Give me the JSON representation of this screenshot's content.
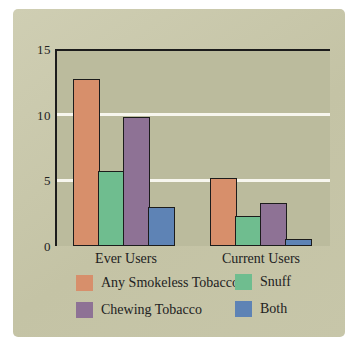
{
  "colors": {
    "page_bg": "#ffffff",
    "card_bg": "#c4c3a5",
    "card_bg_light": "#cfceb3",
    "card_bg2": "#c7c6a9",
    "plot_bg": "#bbbb9d",
    "grid": "#f7f6ee",
    "axis": "#1c1c1c",
    "text": "#222222"
  },
  "chart_data": {
    "type": "bar",
    "title": "",
    "categories": [
      "Ever Users",
      "Current Users"
    ],
    "series": [
      {
        "name": "Any Smokeless Tobacco",
        "color": "#d78f6b",
        "values": [
          12.7,
          5.2
        ]
      },
      {
        "name": "Snuff",
        "color": "#6fbd8f",
        "values": [
          5.7,
          2.3
        ]
      },
      {
        "name": "Chewing Tobacco",
        "color": "#8e7295",
        "values": [
          9.8,
          3.3
        ]
      },
      {
        "name": "Both",
        "color": "#5e83b5",
        "values": [
          3.0,
          0.5
        ]
      }
    ],
    "ylim": [
      0,
      15
    ],
    "yticks": [
      0,
      5,
      10,
      15
    ],
    "gridlines": [
      5,
      10
    ],
    "grid_on": true,
    "xlabel": "",
    "ylabel": "",
    "legend_position": "bottom"
  }
}
